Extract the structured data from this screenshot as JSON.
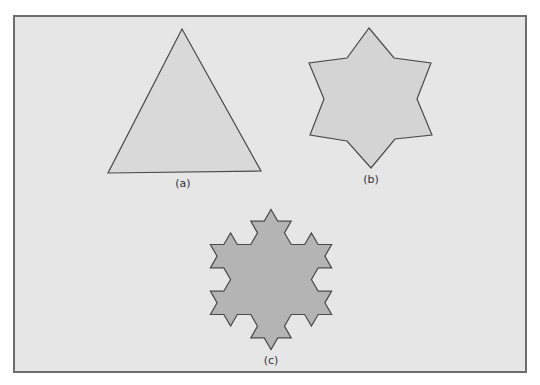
{
  "colors": {
    "page": "#ffffff",
    "panel_bg": "#e6e6e6",
    "panel_border": "#6e6e6e",
    "shape_a_fill": "#d9d9d9",
    "shape_b_fill": "#d4d4d4",
    "shape_c_fill": "#b4b4b4",
    "outline": "#4a4a4a"
  },
  "panel": {
    "x": 14,
    "y": 16,
    "width": 512,
    "height": 356
  },
  "figures": [
    {
      "id": "a",
      "caption": "(a)",
      "description": "Equilateral triangle (Koch iteration 0)",
      "points": [
        [
          182,
          29
        ],
        [
          261,
          171
        ],
        [
          108,
          173
        ]
      ],
      "caption_pos": [
        183,
        187
      ]
    },
    {
      "id": "b",
      "caption": "(b)",
      "description": "Six-pointed star (Koch iteration 1)",
      "points": [
        [
          369,
          28
        ],
        [
          394,
          58
        ],
        [
          431,
          63
        ],
        [
          417,
          99
        ],
        [
          432,
          135
        ],
        [
          395,
          139
        ],
        [
          371,
          168
        ],
        [
          347,
          141
        ],
        [
          310,
          135
        ],
        [
          324,
          99
        ],
        [
          309,
          63
        ],
        [
          347,
          58
        ]
      ],
      "caption_pos": [
        371,
        183
      ]
    },
    {
      "id": "c",
      "caption": "(c)",
      "description": "Koch snowflake (iteration 2)",
      "koch": {
        "cx": 271,
        "cy": 279.5,
        "radius": 70,
        "iterations": 2
      },
      "caption_pos": [
        271,
        364
      ]
    }
  ]
}
